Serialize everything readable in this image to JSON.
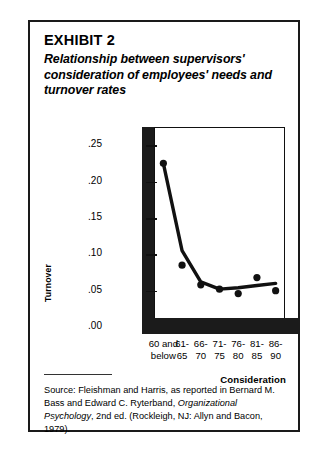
{
  "exhibit": {
    "label": "EXHIBIT 2",
    "subtitle": "Relationship between supervisors' consideration of employees' needs and turnover rates"
  },
  "source": {
    "line1_pre": "Source: Fleishman and Harris, as reported in Bernard M. Bass and Edward C. Ryterband, ",
    "italic": "Organizational Psychology",
    "line1_post": ", 2nd ed. (Rockleigh, NJ: Allyn and Bacon, 1979)."
  },
  "chart_data": {
    "type": "line",
    "title": "Relationship between supervisors' consideration of employees' needs and turnover rates",
    "xlabel": "Consideration",
    "ylabel": "Turnover",
    "categories": [
      "60 and below",
      "61-65",
      "66-70",
      "71-75",
      "76-80",
      "81-85",
      "86-90"
    ],
    "category_lines": [
      [
        "60 and",
        "below"
      ],
      [
        "61-",
        "65"
      ],
      [
        "66-",
        "70"
      ],
      [
        "71-",
        "75"
      ],
      [
        "76-",
        "80"
      ],
      [
        "81-",
        "85"
      ],
      [
        "86-",
        "90"
      ]
    ],
    "ylim": [
      0.0,
      0.275
    ],
    "ytick_labels": [
      ".25",
      ".20",
      ".15",
      ".10",
      ".05",
      ".00"
    ],
    "ytick_values": [
      0.25,
      0.2,
      0.15,
      0.1,
      0.05,
      0.0
    ],
    "grid": false,
    "legend": "none",
    "series": [
      {
        "name": "Turnover rate (observed)",
        "marker": "filled-circle",
        "values": [
          0.225,
          0.085,
          0.058,
          0.052,
          0.046,
          0.068,
          0.05
        ]
      },
      {
        "name": "Fitted trend",
        "marker": "none",
        "values": [
          0.225,
          0.105,
          0.062,
          0.052,
          0.054,
          0.057,
          0.06
        ]
      }
    ],
    "colors": {
      "line": "#111111",
      "marker": "#111111",
      "frame": "#111111"
    }
  }
}
